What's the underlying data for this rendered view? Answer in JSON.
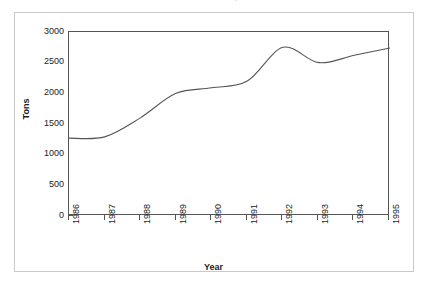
{
  "title": {
    "text": "Annual Production, 1986-95",
    "note": "cropped at top edge of screenshot"
  },
  "chart_data": {
    "type": "line",
    "title": "Annual Production, 1986-95",
    "xlabel": "Year",
    "ylabel": "Tons",
    "x": [
      1986,
      1987,
      1988,
      1989,
      1990,
      1991,
      1992,
      1993,
      1994,
      1995
    ],
    "categories": [
      "1986",
      "1987",
      "1988",
      "1989",
      "1990",
      "1991",
      "1992",
      "1993",
      "1994",
      "1995"
    ],
    "values": [
      1270,
      1290,
      1600,
      2000,
      2090,
      2200,
      2750,
      2500,
      2620,
      2740
    ],
    "series": [
      {
        "name": "Tons",
        "values": [
          1270,
          1290,
          1600,
          2000,
          2090,
          2200,
          2750,
          2500,
          2620,
          2740
        ]
      }
    ],
    "xlim": [
      1986,
      1995
    ],
    "ylim": [
      0,
      3000
    ],
    "ytick_labels": [
      "0",
      "500",
      "1000",
      "1500",
      "2000",
      "2500",
      "3000"
    ],
    "ytick_values": [
      0,
      500,
      1000,
      1500,
      2000,
      2500,
      3000
    ],
    "xtick_labels": [
      "1986",
      "1987",
      "1988",
      "1989",
      "1990",
      "1991",
      "1992",
      "1993",
      "1994",
      "1995"
    ],
    "grid": false,
    "legend": "none",
    "line_color": "#555555",
    "smoothing": "spline",
    "background_color": "#ffffff",
    "axis_color": "#555555",
    "frame_color": "#c9c9c9"
  }
}
